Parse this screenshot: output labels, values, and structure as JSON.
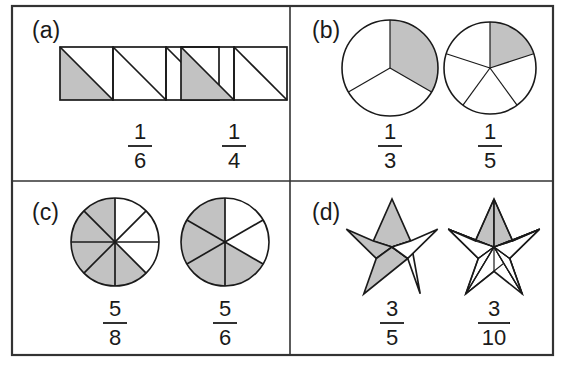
{
  "figure": {
    "colors": {
      "shaded": "#c2c2c2",
      "unshaded": "#ffffff",
      "stroke": "#1a1a1a",
      "frame": "#333333",
      "background": "#ffffff"
    },
    "panels": [
      {
        "id": "a",
        "label": "(a)",
        "model_type": "rectangles-with-diagonals",
        "items": [
          {
            "name": "one-sixth-rectangles",
            "shape": "three squares each split by a diagonal",
            "total_parts": 6,
            "shaded_parts": 1,
            "numerator": "1",
            "denominator": "6",
            "fraction": "1/6"
          },
          {
            "name": "one-quarter-rectangles",
            "shape": "two squares each split by a diagonal",
            "total_parts": 4,
            "shaded_parts": 1,
            "numerator": "1",
            "denominator": "4",
            "fraction": "1/4"
          }
        ]
      },
      {
        "id": "b",
        "label": "(b)",
        "model_type": "circles",
        "items": [
          {
            "name": "one-third-circle",
            "shape": "circle divided into 3 equal sectors",
            "total_parts": 3,
            "shaded_parts": 1,
            "numerator": "1",
            "denominator": "3",
            "fraction": "1/3"
          },
          {
            "name": "one-fifth-circle",
            "shape": "circle divided into 5 equal sectors",
            "total_parts": 5,
            "shaded_parts": 1,
            "numerator": "1",
            "denominator": "5",
            "fraction": "1/5"
          }
        ]
      },
      {
        "id": "c",
        "label": "(c)",
        "model_type": "circles",
        "items": [
          {
            "name": "five-eighths-circle",
            "shape": "circle divided into 8 equal sectors",
            "total_parts": 8,
            "shaded_parts": 5,
            "numerator": "5",
            "denominator": "8",
            "fraction": "5/8"
          },
          {
            "name": "five-sixths-circle",
            "shape": "circle divided into 6 equal sectors",
            "total_parts": 6,
            "shaded_parts": 5,
            "numerator": "5",
            "denominator": "6",
            "fraction": "5/6"
          }
        ]
      },
      {
        "id": "d",
        "label": "(d)",
        "model_type": "stars",
        "items": [
          {
            "name": "three-fifths-star",
            "shape": "five-pointed star divided into 5 kite parts",
            "total_parts": 5,
            "shaded_parts": 3,
            "numerator": "3",
            "denominator": "5",
            "fraction": "3/5"
          },
          {
            "name": "three-tenths-star",
            "shape": "five-pointed star divided into 10 triangular parts",
            "total_parts": 10,
            "shaded_parts": 3,
            "numerator": "3",
            "denominator": "10",
            "fraction": "3/10"
          }
        ]
      }
    ]
  }
}
